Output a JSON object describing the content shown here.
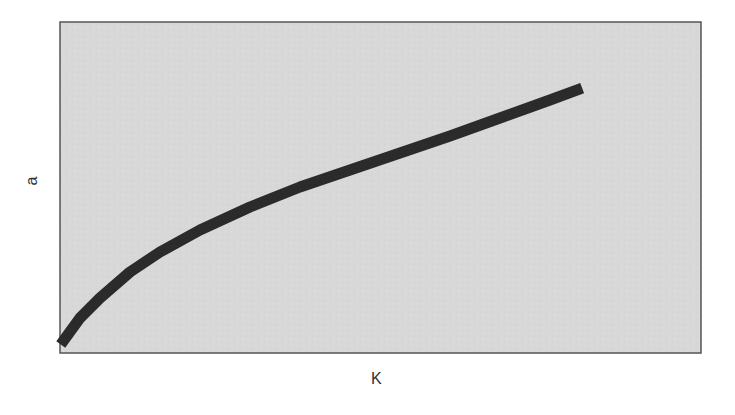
{
  "chart_data": {
    "type": "line",
    "title": "",
    "xlabel": "K",
    "ylabel": "a",
    "grid": false,
    "legend": null,
    "axis_ticks_shown": false,
    "colors": {
      "plot_bg": "#d6d6d6",
      "line": "#2b2b2b",
      "frame": "#555555"
    },
    "plot_box_px": {
      "left": 60,
      "top": 22,
      "right": 701,
      "bottom": 353
    },
    "series": [
      {
        "name": "a(K)",
        "shape": "concave increasing (approx. square-root)",
        "points_px": [
          [
            64,
            340
          ],
          [
            80,
            318
          ],
          [
            100,
            298
          ],
          [
            130,
            272
          ],
          [
            160,
            252
          ],
          [
            200,
            230
          ],
          [
            250,
            207
          ],
          [
            300,
            187
          ],
          [
            350,
            170
          ],
          [
            400,
            153
          ],
          [
            450,
            136
          ],
          [
            500,
            118
          ],
          [
            550,
            100
          ],
          [
            577,
            90
          ]
        ],
        "x_norm": [
          0.006,
          0.031,
          0.062,
          0.109,
          0.156,
          0.218,
          0.296,
          0.374,
          0.452,
          0.53,
          0.608,
          0.686,
          0.764,
          0.806
        ],
        "y_norm": [
          0.04,
          0.106,
          0.166,
          0.245,
          0.305,
          0.372,
          0.441,
          0.502,
          0.553,
          0.604,
          0.656,
          0.71,
          0.764,
          0.795
        ]
      }
    ]
  }
}
